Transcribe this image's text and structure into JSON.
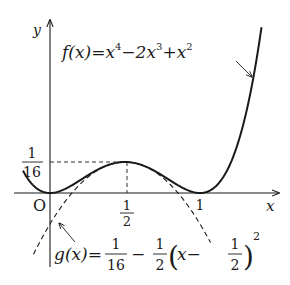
{
  "chart_data": {
    "type": "line",
    "title": "",
    "xlabel": "x",
    "ylabel": "y",
    "origin_label": "O",
    "x_ticks": [
      {
        "value": 0.5,
        "label": "1/2"
      },
      {
        "value": 1,
        "label": "1"
      }
    ],
    "y_ticks": [
      {
        "value": 0.0625,
        "label": "1/16"
      }
    ],
    "xlim": [
      -0.18,
      1.52
    ],
    "ylim": [
      -0.15,
      0.35
    ],
    "grid": false,
    "series": [
      {
        "name": "f(x) = x^4 - 2x^3 + x^2",
        "style": "solid",
        "x": [
          -0.18,
          0,
          0.25,
          0.5,
          0.75,
          1,
          1.25,
          1.41
        ],
        "y": [
          0.0451,
          0,
          0.0352,
          0.0625,
          0.0352,
          0,
          0.0977,
          0.335
        ]
      },
      {
        "name": "g(x) = 1/16 - 1/2 (x - 1/2)^2",
        "style": "dashed",
        "x": [
          -0.11,
          0,
          0.25,
          0.5,
          0.75,
          1,
          1.07
        ],
        "y": [
          -0.124,
          -0.0625,
          0.03125,
          0.0625,
          0.03125,
          -0.0625,
          -0.1
        ]
      }
    ],
    "annotations": [
      {
        "text": "f(x)=x^4-2x^3+x^2",
        "points_to": "f curve near x≈1.3"
      },
      {
        "text": "g(x)=1/16-1/2(x-1/2)^2",
        "points_to": "g curve near x≈0.05"
      },
      {
        "text": "dashed guide lines",
        "from": [
          0,
          0.0625
        ],
        "to": [
          0.5,
          0.0625
        ]
      },
      {
        "text": "dashed guide line",
        "from": [
          0.5,
          0.0625
        ],
        "to": [
          0.5,
          0
        ]
      }
    ]
  },
  "labels": {
    "y_axis": "y",
    "x_axis": "x",
    "origin": "O",
    "tick_half_num": "1",
    "tick_half_den": "2",
    "tick_one": "1",
    "tick_16_num": "1",
    "tick_16_den": "16",
    "f_label": {
      "prefix": "f(x)=x",
      "exp1": "4",
      "mid": "−2x",
      "exp2": "3",
      "mid2": "+x",
      "exp3": "2"
    },
    "g_label": {
      "prefix": "g(x)=",
      "frac1_num": "1",
      "frac1_den": "16",
      "minus": "−",
      "frac2_num": "1",
      "frac2_den": "2",
      "paren_open": "(",
      "inner": "x−",
      "frac3_num": "1",
      "frac3_den": "2",
      "paren_close": ")",
      "exp": "2"
    }
  },
  "colors": {
    "ink": "#1a1a1a",
    "background": "#ffffff"
  }
}
